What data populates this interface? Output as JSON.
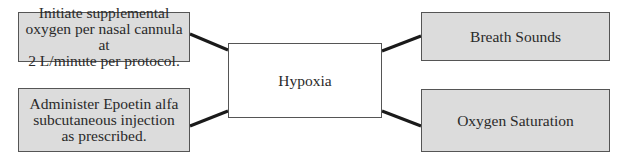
{
  "diagram": {
    "center": {
      "label": "Hypoxia"
    },
    "left": [
      {
        "label": "Initiate supplemental oxygen per nasal cannula at 2 L/minute per protocol.",
        "lines": [
          "Initiate supplemental",
          "oxygen per nasal cannula at",
          "2 L/minute per protocol."
        ]
      },
      {
        "label": "Administer Epoetin alfa subcutaneous injection as prescribed.",
        "lines": [
          "Administer Epoetin alfa",
          "subcutaneous injection",
          "as prescribed."
        ]
      }
    ],
    "right": [
      {
        "label": "Breath Sounds"
      },
      {
        "label": "Oxygen Saturation"
      }
    ],
    "colors": {
      "shaded_fill": "#dcdcdc",
      "border": "#555555",
      "connector": "#1a1a1a"
    }
  }
}
